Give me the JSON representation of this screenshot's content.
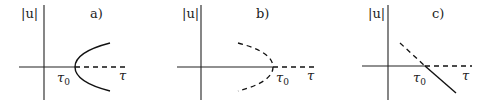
{
  "panels": [
    {
      "id": "a",
      "panel_label": "a)",
      "y_axis_label": "|u|",
      "x_axis_label": "τ",
      "critical_label": "τ",
      "critical_sub": "0",
      "description": "Supercritical pitchfork: stable branches (solid) emerge to the right of τ0; trivial solution becomes unstable (dashed) beyond τ0"
    },
    {
      "id": "b",
      "panel_label": "b)",
      "y_axis_label": "|u|",
      "x_axis_label": "τ",
      "critical_label": "τ",
      "critical_sub": "0",
      "description": "Subcritical pitchfork: unstable branches (dashed) exist to the left of τ0; trivial solution stable (solid) before τ0, unstable (dashed) after"
    },
    {
      "id": "c",
      "panel_label": "c)",
      "y_axis_label": "|u|",
      "x_axis_label": "τ",
      "critical_label": "τ",
      "critical_sub": "0",
      "description": "Transcritical bifurcation: a line crossing the axis at τ0, dashed before and solid after; trivial solution solid before τ0, dashed after"
    }
  ]
}
